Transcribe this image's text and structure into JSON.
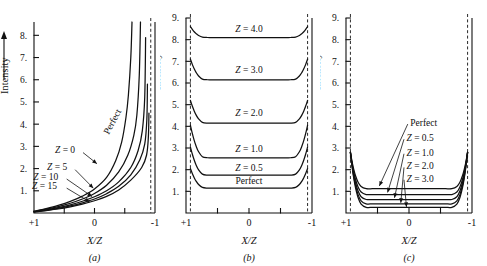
{
  "figure": {
    "background": "#ffffff",
    "ink": "#111111",
    "ylabel": "Intensity",
    "xlabel": "X/Z",
    "x_left_label": "+1",
    "x_mid_label": "0",
    "x_right_label": "-1"
  },
  "chart_data": [
    {
      "type": "line",
      "panel": "a",
      "caption": "(a)",
      "title": "",
      "xlabel": "X/Z",
      "ylabel": "Intensity",
      "xlim": [
        1,
        -1
      ],
      "ylim": [
        0,
        8.6
      ],
      "xticks": [
        1,
        0.5,
        0,
        -0.5,
        -1
      ],
      "xticklabels": [
        "+1",
        "",
        "0",
        "",
        "-1"
      ],
      "yticks": [
        1,
        2,
        3,
        4,
        5,
        6,
        7,
        8
      ],
      "yticklabels": [
        "1.",
        "2.",
        "3.",
        "4.",
        "5.",
        "6.",
        "7.",
        "8."
      ],
      "grid": false,
      "legend": "inline-annotations",
      "asymptote_x": -0.93,
      "series": [
        {
          "name": "Perfect",
          "label": "Perfect",
          "label_rotated": true,
          "x": [
            1.0,
            0.8,
            0.6,
            0.4,
            0.2,
            0.0,
            -0.2,
            -0.35,
            -0.45,
            -0.52,
            -0.56,
            -0.6,
            -0.62
          ],
          "y": [
            0.08,
            0.2,
            0.34,
            0.52,
            0.76,
            1.08,
            1.6,
            2.35,
            3.2,
            4.3,
            5.3,
            7.0,
            8.6
          ]
        },
        {
          "name": "Z = 0",
          "label": "Z = 0",
          "x": [
            1.0,
            0.8,
            0.6,
            0.4,
            0.2,
            0.0,
            -0.2,
            -0.4,
            -0.55,
            -0.65,
            -0.7,
            -0.74,
            -0.76
          ],
          "y": [
            0.07,
            0.17,
            0.29,
            0.44,
            0.63,
            0.88,
            1.25,
            1.85,
            2.6,
            3.5,
            4.4,
            6.2,
            8.6
          ]
        },
        {
          "name": "Z = 5",
          "label": "Z = 5",
          "x": [
            1.0,
            0.8,
            0.6,
            0.4,
            0.2,
            0.0,
            -0.2,
            -0.4,
            -0.6,
            -0.72,
            -0.79,
            -0.83,
            -0.845
          ],
          "y": [
            0.06,
            0.14,
            0.24,
            0.37,
            0.53,
            0.73,
            1.0,
            1.4,
            2.05,
            2.8,
            3.7,
            5.2,
            7.9
          ]
        },
        {
          "name": "Z = 10",
          "label": "Z = 10",
          "x": [
            1.0,
            0.8,
            0.6,
            0.4,
            0.2,
            0.0,
            -0.2,
            -0.4,
            -0.6,
            -0.75,
            -0.83,
            -0.865,
            -0.875
          ],
          "y": [
            0.05,
            0.12,
            0.21,
            0.32,
            0.46,
            0.63,
            0.87,
            1.2,
            1.72,
            2.4,
            3.1,
            4.2,
            5.8
          ]
        },
        {
          "name": "Z = 15",
          "label": "Z = 15",
          "x": [
            1.0,
            0.8,
            0.6,
            0.4,
            0.2,
            0.0,
            -0.2,
            -0.4,
            -0.6,
            -0.78,
            -0.86,
            -0.89,
            -0.9
          ],
          "y": [
            0.05,
            0.11,
            0.18,
            0.28,
            0.4,
            0.55,
            0.75,
            1.04,
            1.48,
            2.05,
            2.6,
            3.4,
            4.5
          ]
        }
      ],
      "annotations": [
        {
          "text": "Z = 0",
          "x": 0.32,
          "y": 2.85
        },
        {
          "text": "Z = 5",
          "x": 0.45,
          "y": 2.05
        },
        {
          "text": "Z = 10",
          "x": 0.6,
          "y": 1.62
        },
        {
          "text": "Z = 15",
          "x": 0.62,
          "y": 1.2
        },
        {
          "text": "Perfect",
          "x": -0.34,
          "y": 4.05,
          "rotated": true
        }
      ]
    },
    {
      "type": "line",
      "panel": "b",
      "caption": "(b)",
      "title": "",
      "xlabel": "X/Z",
      "ylabel": "Intensity",
      "xlim": [
        1,
        -1
      ],
      "ylim": [
        0,
        9.0
      ],
      "xticks": [
        1,
        0.5,
        0,
        -0.5,
        -1
      ],
      "xticklabels": [
        "+1",
        "",
        "0",
        "",
        "-1"
      ],
      "yticks": [
        1,
        2,
        3,
        4,
        5,
        6,
        7,
        8,
        9
      ],
      "yticklabels": [
        "1.",
        "2.",
        "3.",
        "4.",
        "5.",
        "6.",
        "7.",
        "8.",
        "9."
      ],
      "grid": false,
      "legend": "inline-labels",
      "asymptote_left_x": 0.93,
      "asymptote_right_x": -0.93,
      "series": [
        {
          "name": "Z = 4.0",
          "label": "Z = 4.0",
          "plateau": 8.1,
          "edge": 8.6,
          "label_y": 8.5
        },
        {
          "name": "Z = 3.0",
          "label": "Z = 3.0",
          "plateau": 6.15,
          "edge": 7.1,
          "label_y": 6.6
        },
        {
          "name": "Z = 2.0",
          "label": "Z = 2.0",
          "plateau": 4.15,
          "edge": 5.2,
          "label_y": 4.6
        },
        {
          "name": "Z = 1.0",
          "label": "Z = 1.0",
          "plateau": 2.55,
          "edge": 4.05,
          "label_y": 2.95
        },
        {
          "name": "Z = 0.5",
          "label": "Z = 0.5",
          "plateau": 1.75,
          "edge": 3.05,
          "label_y": 2.1
        },
        {
          "name": "Perfect",
          "label": "Perfect",
          "plateau": 1.15,
          "edge": 2.05,
          "label_y": 1.5
        }
      ]
    },
    {
      "type": "line",
      "panel": "c",
      "caption": "(c)",
      "title": "",
      "xlabel": "X/Z",
      "ylabel": "Intensity",
      "xlim": [
        1,
        -1
      ],
      "ylim": [
        0,
        9.0
      ],
      "xticks": [
        1,
        0.5,
        0,
        -0.5,
        -1
      ],
      "xticklabels": [
        "+1",
        "",
        "0",
        "",
        "-1"
      ],
      "yticks": [
        1,
        2,
        3,
        4,
        5,
        6,
        7,
        8,
        9
      ],
      "yticklabels": [
        "1.",
        "2.",
        "3.",
        "4.",
        "5.",
        "6.",
        "7.",
        "8.",
        "9."
      ],
      "grid": false,
      "legend": "leader-lines",
      "asymptote_left_x": 0.93,
      "asymptote_right_x": -0.93,
      "series": [
        {
          "name": "Perfect",
          "label": "Perfect",
          "plateau": 1.12,
          "edge": 2.8
        },
        {
          "name": "Z = 0.5",
          "label": "Z = 0.5",
          "plateau": 0.85,
          "edge": 2.8
        },
        {
          "name": "Z = 1.0",
          "label": "Z = 1.0",
          "plateau": 0.62,
          "edge": 2.8
        },
        {
          "name": "Z = 2.0",
          "label": "Z = 2.0",
          "plateau": 0.42,
          "edge": 2.8
        },
        {
          "name": "Z = 3.0",
          "label": "Z = 3.0",
          "plateau": 0.26,
          "edge": 2.8
        }
      ],
      "annotations": [
        {
          "text": "Perfect",
          "x": -0.02,
          "y": 4.15,
          "target_x": 0.47,
          "target_y": 1.25
        },
        {
          "text": "Z = 0.5",
          "x": 0.04,
          "y": 3.45,
          "target_x": 0.34,
          "target_y": 0.95
        },
        {
          "text": "Z = 1.0",
          "x": 0.04,
          "y": 2.78,
          "target_x": 0.23,
          "target_y": 0.7
        },
        {
          "text": "Z = 2.0",
          "x": 0.04,
          "y": 2.15,
          "target_x": 0.13,
          "target_y": 0.47
        },
        {
          "text": "Z = 3.0",
          "x": 0.04,
          "y": 1.58,
          "target_x": 0.04,
          "target_y": 0.28
        }
      ]
    }
  ]
}
